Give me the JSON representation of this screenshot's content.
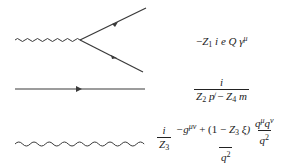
{
  "rules": [
    {
      "name": "vertex",
      "diagram": "photon-fermion vertex",
      "formula": {
        "text": "−Z1 i e Q γ^μ",
        "minus": "−",
        "Z": "Z",
        "Z_sub": "1",
        "i": "i",
        "e": "e",
        "Q": "Q",
        "gamma": "γ",
        "gamma_sup": "μ"
      }
    },
    {
      "name": "fermion-propagator",
      "diagram": "straight line with arrow",
      "formula": {
        "numerator": "i",
        "den_Z2": "Z",
        "den_Z2_sub": "2",
        "den_pslash": "p̸",
        "den_minus": "−",
        "den_Z4": "Z",
        "den_Z4_sub": "4",
        "den_m": "m"
      }
    },
    {
      "name": "photon-propagator",
      "diagram": "wavy line",
      "formula": {
        "pre_num": "i",
        "pre_den_Z": "Z",
        "pre_den_sub": "3",
        "num_g": "−g",
        "num_g_sup": "μν",
        "num_mid": "+ (1 − ",
        "num_Z": "Z",
        "num_Z_sub": "3",
        "num_xi": "ξ)",
        "inner_num_q1": "q",
        "inner_num_q1_sup": "μ",
        "inner_num_q2": "q",
        "inner_num_q2_sup": "ν",
        "inner_den_q": "q",
        "inner_den_sup": "2",
        "den_q": "q",
        "den_sup": "2"
      }
    }
  ],
  "colors": {
    "line": "#3a3a3a",
    "text": "#222222",
    "background": "#ffffff"
  }
}
